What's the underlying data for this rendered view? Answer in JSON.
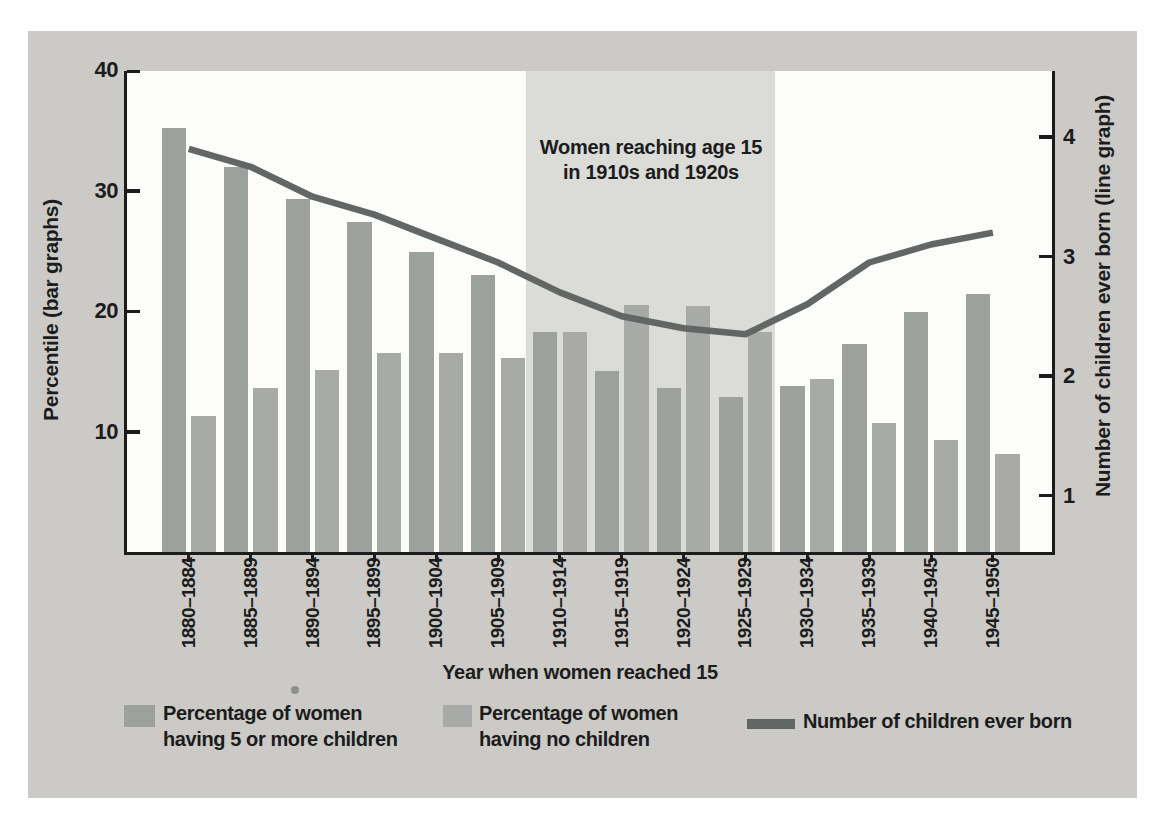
{
  "figure": {
    "annotation": {
      "line1": "Women reaching age 15",
      "line2": "in 1910s and 1920s"
    },
    "x_axis_title": "Year when women reached 15",
    "left_axis_title": "Percentile (bar graphs)",
    "right_axis_title": "Number of children ever born (line graph)",
    "legend": [
      {
        "line1": "Percentage of women",
        "line2": "having 5 or more children"
      },
      {
        "line1": "Percentage of women",
        "line2": "having no children"
      },
      {
        "line1": "Number of children ever born",
        "line2": ""
      }
    ]
  },
  "colors": {
    "page_bg": "#ffffff",
    "panel_bg": "#cbcac7",
    "plot_bg": "#fcfcfa",
    "band_bg": "#dbdbd8",
    "bar_five_plus": "#9da19e",
    "bar_no_children": "#a7aaa7",
    "line": "#626664",
    "axis_and_text": "#1c1c1c"
  },
  "chart_data": {
    "type": "bar",
    "subtype": "grouped bars with overlaid line, dual y-axes",
    "categories": [
      "1880–1884",
      "1885–1889",
      "1890–1894",
      "1895–1899",
      "1900–1904",
      "1905–1909",
      "1910–1914",
      "1915–1919",
      "1920–1924",
      "1925–1929",
      "1930–1934",
      "1935–1939",
      "1940–1945",
      "1945–1950"
    ],
    "series": [
      {
        "name": "Percentage of women having 5 or more children",
        "type": "bar",
        "axis": "left",
        "color": "#9da19e",
        "values": [
          35.2,
          32.0,
          29.3,
          27.4,
          24.9,
          23.0,
          18.3,
          15.0,
          13.6,
          12.9,
          13.8,
          17.3,
          19.9,
          21.4
        ]
      },
      {
        "name": "Percentage of women having no children",
        "type": "bar",
        "axis": "left",
        "color": "#a7aaa7",
        "values": [
          11.3,
          13.6,
          15.1,
          16.5,
          16.5,
          16.1,
          18.3,
          20.5,
          20.4,
          18.3,
          14.4,
          10.7,
          9.3,
          8.1
        ]
      },
      {
        "name": "Number of children ever born",
        "type": "line",
        "axis": "right",
        "color": "#626664",
        "values": [
          3.9,
          3.75,
          3.5,
          3.35,
          3.15,
          2.95,
          2.7,
          2.5,
          2.4,
          2.35,
          2.6,
          2.95,
          3.1,
          3.2
        ]
      }
    ],
    "left_axis": {
      "label": "Percentile (bar graphs)",
      "range": [
        0,
        40
      ],
      "ticks": [
        10,
        20,
        30,
        40
      ]
    },
    "right_axis": {
      "label": "Number of children ever born (line graph)",
      "ticks": [
        1,
        2,
        3,
        4
      ]
    },
    "x_axis": {
      "label": "Year when women reached 15"
    },
    "highlight_band": {
      "from_category": "1910–1914",
      "to_category": "1925–1929",
      "label": "Women reaching age 15 in 1910s and 1920s"
    },
    "grid": false,
    "legend_position": "bottom"
  }
}
